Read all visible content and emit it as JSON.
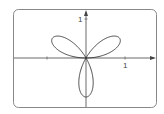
{
  "chart_data": {
    "type": "line",
    "subtype": "polar-rose",
    "title": "",
    "equation": "r = sin(3θ)",
    "theta_range": [
      0,
      3.14159
    ],
    "petals": 3,
    "petal_directions_deg": [
      30,
      150,
      270
    ],
    "xlabel": "",
    "ylabel": "",
    "xlim": [
      -1.9,
      1.8
    ],
    "ylim": [
      -1.25,
      1.25
    ],
    "x_ticks": [
      {
        "value": -1,
        "label": ""
      },
      {
        "value": 1,
        "label": "1"
      }
    ],
    "y_ticks": [
      {
        "value": 1,
        "label": "1"
      }
    ],
    "grid": false,
    "legend": null,
    "frame": "rounded-rectangle"
  },
  "labels": {
    "x_tick_1": "1",
    "y_tick_1": "1"
  },
  "colors": {
    "curve": "#333333",
    "axes": "#444444",
    "frame": "#888888",
    "background": "#ffffff"
  },
  "geometry": {
    "origin_x": 86,
    "origin_y": 58,
    "scale_px_per_unit": 39
  }
}
